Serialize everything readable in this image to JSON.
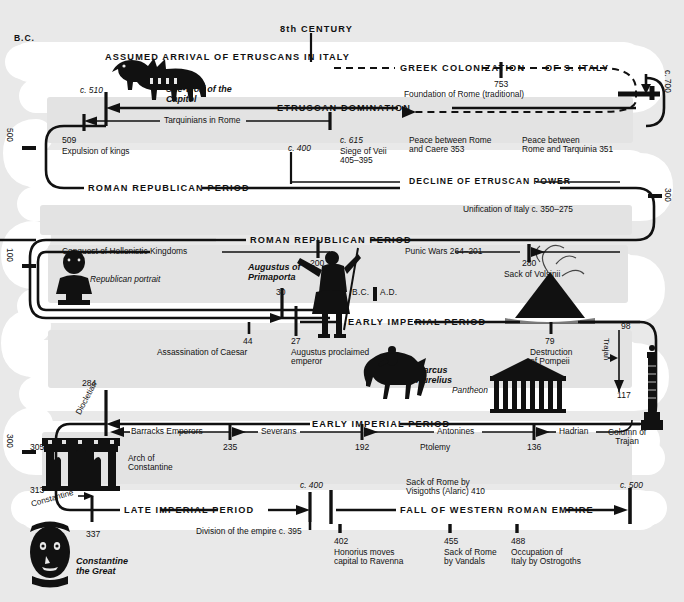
{
  "meta": {
    "era_top_left": "B.C.",
    "background_color": "#e9e9e9",
    "track_color": "#ffffff",
    "ink_color": "#111111"
  },
  "edge_markers": {
    "left": [
      {
        "label": "500"
      },
      {
        "label": "100"
      },
      {
        "label": "300"
      },
      {
        "label": "305"
      },
      {
        "label": "313"
      }
    ],
    "right": [
      {
        "label": "c. 700"
      },
      {
        "label": "300"
      },
      {
        "label": "98"
      },
      {
        "label": "117"
      }
    ]
  },
  "row1": {
    "top_marker": "8th CENTURY",
    "band_left": "ASSUMED ARRIVAL OF ETRUSCANS IN ITALY",
    "band_dashed_a": "GREEK COLONIZATION",
    "band_dashed_b": "OF S. ITALY",
    "year": "753",
    "event": "Foundation of Rome (traditional)",
    "right_edge": "c. 700"
  },
  "row2": {
    "figure_caption": "She-Wolf of the\nCapitol",
    "marker": "c. 510",
    "band": "ETRUSCAN DOMINATION",
    "sub_band": "Tarquinians in Rome",
    "left_edge": "500",
    "events": [
      {
        "year": "509",
        "text": "Expulsion of kings"
      },
      {
        "year": "c. 400",
        "text": ""
      },
      {
        "year": "c. 615",
        "text": "Siege of Veii\n405–395"
      },
      {
        "year": "",
        "text": "Peace between Rome\nand Caere 353"
      },
      {
        "year": "",
        "text": "Peace between\nRome and Tarquinia 351"
      }
    ]
  },
  "row3": {
    "band_left": "ROMAN REPUBLICAN PERIOD",
    "band_right": "DECLINE OF ETRUSCAN POWER",
    "right_edge": "300",
    "note_right": "Unification of Italy c. 350–275"
  },
  "row4": {
    "band": "ROMAN REPUBLICAN PERIOD",
    "sub_left": "Conquest of Hellenistic Kingdoms",
    "sub_right": "Punic Wars 264–201",
    "left_edge": "100",
    "markers": [
      {
        "year": "200",
        "text": ""
      },
      {
        "year": "280",
        "text": "Sack of Volsinii"
      }
    ],
    "figure_caption_left": "Republican portrait",
    "figure_caption_mid": "Augustus of\nPrimaporta",
    "era_switch": "B.C.",
    "era_switch2": "A.D.",
    "marker_30": "30"
  },
  "row5": {
    "band": "EARLY IMPERIAL PERIOD",
    "events": [
      {
        "year": "44",
        "text": "Assassination of Caesar"
      },
      {
        "year": "27",
        "text": "Augustus proclaimed\nemperor"
      },
      {
        "year": "79",
        "text": "Destruction\nof Pompeii"
      }
    ],
    "figure_caption_horse": "Marcus\nAurelius",
    "figure_caption_temple": "Pantheon",
    "right_edge_top": "98",
    "right_edge_bottom": "117",
    "trajan_label": "Trajan",
    "column_caption": "Column of\nTrajan"
  },
  "row6": {
    "band": "EARLY IMPERIAL PERIOD",
    "marker_284": "284",
    "diocletian": "Diocletian",
    "sub_bands": [
      {
        "label": "Barracks Emperors",
        "year": "235"
      },
      {
        "label": "Severans",
        "year": "192"
      },
      {
        "label": "Antonines",
        "year": "136"
      },
      {
        "label": "Hadrian",
        "year": ""
      }
    ],
    "ptolemy": "Ptolemy",
    "arch_caption": "Arch of\nConstantine",
    "left_edges": [
      "300",
      "305",
      "313"
    ],
    "constantine": "Constantine"
  },
  "row7": {
    "band_left": "LATE IMPERIAL PERIOD",
    "band_right": "FALL OF WESTERN ROMAN EMPIRE",
    "marker_c400": "c. 400",
    "marker_c500": "c. 500",
    "note_sack": "Sack of Rome by\nVisigoths (Alaric) 410",
    "note_division": "Division of the empire c. 395",
    "figure_caption": "Constantine\nthe Great",
    "events": [
      {
        "year": "337",
        "text": ""
      },
      {
        "year": "402",
        "text": "Honorius moves\ncapital to Ravenna"
      },
      {
        "year": "455",
        "text": "Sack of Rome\nby Vandals"
      },
      {
        "year": "488",
        "text": "Occupation of\nItaly by Ostrogoths"
      }
    ]
  }
}
